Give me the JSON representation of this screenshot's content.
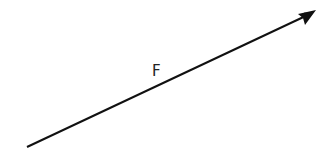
{
  "diagram": {
    "type": "force-vector",
    "vector": {
      "label": "F",
      "start": [
        27,
        147
      ],
      "end": [
        316,
        11
      ],
      "color": "#111111",
      "stroke_width": 2
    },
    "label_position": [
      152,
      76
    ]
  }
}
